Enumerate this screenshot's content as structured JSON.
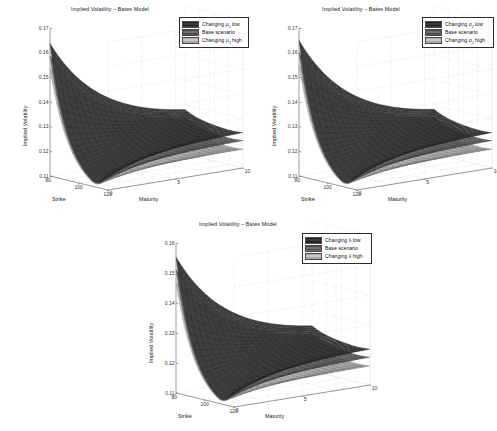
{
  "figure": {
    "background": "#ffffff",
    "panel_count": 3
  },
  "common": {
    "title": "Implied Volatility – Bates Model",
    "xlabel": "Strike",
    "zlabel": "Maturity",
    "ylabel": "Implied Volatility",
    "strike_ticks": [
      "80",
      "100",
      "120"
    ],
    "maturity_ticks": [
      "0",
      "5",
      "10"
    ],
    "base_label": "Base scenario",
    "colors": {
      "surface_low": "#3a3a3a",
      "surface_base": "#6e6e6e",
      "surface_high": "#c9c9c9",
      "axis": "#4d4d4d",
      "grid": "#c8c8c8",
      "text": "#1a1a1a"
    }
  },
  "chart_data": [
    {
      "id": "panel-1",
      "type": "surface",
      "title": "Implied Volatility – Bates Model",
      "xlabel": "Strike",
      "ylabel": "Implied Volatility",
      "zlabel": "Maturity",
      "parameter": "mu_J",
      "parameter_symbol": "μ",
      "parameter_subscript": "J",
      "xlim": [
        80,
        120
      ],
      "zlim": [
        0,
        10
      ],
      "ylim": [
        0.11,
        0.17
      ],
      "ytick_labels": [
        "0.11",
        "0.12",
        "0.13",
        "0.14",
        "0.15",
        "0.16",
        "0.17"
      ],
      "ytick_values": [
        0.11,
        0.12,
        0.13,
        0.14,
        0.15,
        0.16,
        0.17
      ],
      "xtick_labels": [
        "80",
        "100",
        "120"
      ],
      "ztick_labels": [
        "0",
        "5",
        "10"
      ],
      "grid": true,
      "legend_position": "top-right",
      "legend": [
        {
          "label": "Changing μ",
          "subscript": "J",
          "suffix": " low",
          "color": "#3a3a3a"
        },
        {
          "label": "Base scenario",
          "subscript": "",
          "suffix": "",
          "color": "#6e6e6e"
        },
        {
          "label": "Changing μ",
          "subscript": "J",
          "suffix": " high",
          "color": "#c9c9c9"
        }
      ],
      "series": [
        {
          "name": "Changing mu_J low",
          "color": "#3a3a3a",
          "smile_short_maturity": [
            0.166,
            0.149,
            0.135,
            0.127,
            0.136
          ],
          "smile_long_maturity": [
            0.141,
            0.134,
            0.129,
            0.127,
            0.13
          ]
        },
        {
          "name": "Base scenario",
          "color": "#6e6e6e",
          "smile_short_maturity": [
            0.16,
            0.145,
            0.133,
            0.126,
            0.133
          ],
          "smile_long_maturity": [
            0.138,
            0.131,
            0.127,
            0.125,
            0.127
          ]
        },
        {
          "name": "Changing mu_J high",
          "color": "#c9c9c9",
          "smile_short_maturity": [
            0.157,
            0.142,
            0.13,
            0.124,
            0.13
          ],
          "smile_long_maturity": [
            0.134,
            0.128,
            0.124,
            0.122,
            0.123
          ]
        }
      ]
    },
    {
      "id": "panel-2",
      "type": "surface",
      "title": "Implied Volatility – Bates Model",
      "xlabel": "Strike",
      "ylabel": "Implied Volatility",
      "zlabel": "Maturity",
      "parameter": "sigma_J",
      "parameter_symbol": "σ",
      "parameter_subscript": "J",
      "xlim": [
        80,
        120
      ],
      "zlim": [
        0,
        10
      ],
      "ylim": [
        0.11,
        0.17
      ],
      "ytick_labels": [
        "0.11",
        "0.12",
        "0.13",
        "0.14",
        "0.15",
        "0.16",
        "0.17"
      ],
      "ytick_values": [
        0.11,
        0.12,
        0.13,
        0.14,
        0.15,
        0.16,
        0.17
      ],
      "xtick_labels": [
        "80",
        "100",
        "120"
      ],
      "ztick_labels": [
        "0",
        "5",
        "10"
      ],
      "grid": true,
      "legend_position": "top-right",
      "legend": [
        {
          "label": "Changing σ",
          "subscript": "J",
          "suffix": " low",
          "color": "#3a3a3a"
        },
        {
          "label": "Base scenario",
          "subscript": "",
          "suffix": "",
          "color": "#6e6e6e"
        },
        {
          "label": "Changing σ",
          "subscript": "J",
          "suffix": " high",
          "color": "#c9c9c9"
        }
      ],
      "series": [
        {
          "name": "Changing sigma_J low",
          "color": "#3a3a3a",
          "smile_short_maturity": [
            0.163,
            0.147,
            0.134,
            0.127,
            0.135
          ],
          "smile_long_maturity": [
            0.14,
            0.133,
            0.129,
            0.127,
            0.13
          ]
        },
        {
          "name": "Base scenario",
          "color": "#6e6e6e",
          "smile_short_maturity": [
            0.159,
            0.144,
            0.132,
            0.125,
            0.132
          ],
          "smile_long_maturity": [
            0.137,
            0.13,
            0.126,
            0.124,
            0.126
          ]
        },
        {
          "name": "Changing sigma_J high",
          "color": "#c9c9c9",
          "smile_short_maturity": [
            0.155,
            0.141,
            0.129,
            0.123,
            0.129
          ],
          "smile_long_maturity": [
            0.133,
            0.127,
            0.123,
            0.121,
            0.122
          ]
        }
      ]
    },
    {
      "id": "panel-3",
      "type": "surface",
      "title": "Implied Volatility – Bates Model",
      "xlabel": "Strike",
      "ylabel": "Implied Volatility",
      "zlabel": "Maturity",
      "parameter": "lambda",
      "parameter_symbol": "λ",
      "parameter_subscript": "",
      "xlim": [
        80,
        120
      ],
      "zlim": [
        0,
        10
      ],
      "ylim": [
        0.11,
        0.16
      ],
      "ytick_labels": [
        "0.11",
        "0.12",
        "0.13",
        "0.14",
        "0.15",
        "0.16"
      ],
      "ytick_values": [
        0.11,
        0.12,
        0.13,
        0.14,
        0.15,
        0.16
      ],
      "xtick_labels": [
        "80",
        "100",
        "120"
      ],
      "ztick_labels": [
        "0",
        "5",
        "10"
      ],
      "grid": true,
      "legend_position": "top-right",
      "legend": [
        {
          "label": "Changing λ",
          "subscript": "",
          "suffix": " low",
          "color": "#3a3a3a"
        },
        {
          "label": "Base scenario",
          "subscript": "",
          "suffix": "",
          "color": "#6e6e6e"
        },
        {
          "label": "Changing λ",
          "subscript": "",
          "suffix": " high",
          "color": "#c9c9c9"
        }
      ],
      "series": [
        {
          "name": "Changing lambda low",
          "color": "#3a3a3a",
          "smile_short_maturity": [
            0.158,
            0.145,
            0.133,
            0.126,
            0.134
          ],
          "smile_long_maturity": [
            0.137,
            0.13,
            0.126,
            0.125,
            0.128
          ]
        },
        {
          "name": "Base scenario",
          "color": "#6e6e6e",
          "smile_short_maturity": [
            0.156,
            0.143,
            0.131,
            0.124,
            0.131
          ],
          "smile_long_maturity": [
            0.134,
            0.128,
            0.124,
            0.122,
            0.124
          ]
        },
        {
          "name": "Changing lambda high",
          "color": "#c9c9c9",
          "smile_short_maturity": [
            0.153,
            0.14,
            0.128,
            0.122,
            0.128
          ],
          "smile_long_maturity": [
            0.131,
            0.125,
            0.121,
            0.119,
            0.12
          ]
        }
      ]
    }
  ]
}
